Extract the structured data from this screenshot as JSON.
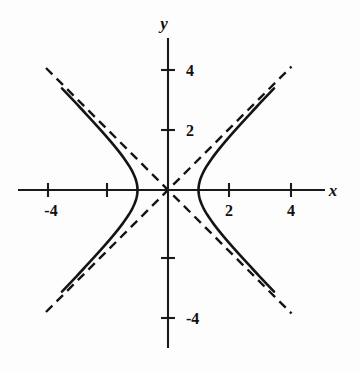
{
  "figure": {
    "background_color": "#fdfdfd",
    "ink_color": "#141414"
  },
  "axes": {
    "x_axis_label": "x",
    "y_axis_label": "y",
    "x_label_position": {
      "px": 333,
      "py": 196
    },
    "y_label_position": {
      "px": 164,
      "py": 29
    },
    "origin_px": {
      "x": 168,
      "y": 190
    },
    "pixels_per_unit": 30.5,
    "x_axis_extent_px": {
      "from": 18,
      "to": 325
    },
    "y_axis_extent_px": {
      "from": 38,
      "to": 348
    }
  },
  "ticks": {
    "x": [
      {
        "value": -4,
        "label": "-4",
        "px": 48,
        "labeled": true
      },
      {
        "value": -2,
        "label": "",
        "px": 107,
        "labeled": false
      },
      {
        "value": 2,
        "label": "2",
        "px": 229,
        "labeled": true
      },
      {
        "value": 4,
        "label": "4",
        "px": 291,
        "labeled": true
      }
    ],
    "y": [
      {
        "value": 4,
        "label": "4",
        "py": 70,
        "labeled": true
      },
      {
        "value": 2,
        "label": "2",
        "py": 130,
        "labeled": true
      },
      {
        "value": -2,
        "label": "",
        "py": 258,
        "labeled": false
      },
      {
        "value": -4,
        "label": "-4",
        "py": 318,
        "labeled": true
      }
    ]
  },
  "chart_data": {
    "type": "line",
    "title": "",
    "subtitle": "",
    "xlabel": "x",
    "ylabel": "y",
    "xlim": [
      -4.9,
      5.15
    ],
    "ylim": [
      -5.2,
      5.0
    ],
    "grid": false,
    "legend": null,
    "annotations": [],
    "equation": "x^2 - y^2 = 1",
    "curve_family": "hyperbola",
    "parameters": {
      "a": 1,
      "b": 1,
      "center": [
        0,
        0
      ],
      "orientation": "horizontal"
    },
    "vertices": [
      [
        -1,
        0
      ],
      [
        1,
        0
      ]
    ],
    "xticks": [
      -4,
      -2,
      2,
      4
    ],
    "xticklabels": [
      "-4",
      "",
      "2",
      "4"
    ],
    "yticks": [
      4,
      2,
      -2,
      -4
    ],
    "yticklabels": [
      "4",
      "2",
      "",
      "-4"
    ],
    "series": [
      {
        "name": "right branch",
        "style": "solid",
        "color": "#141414",
        "points": [
          [
            1.0,
            0.0
          ],
          [
            1.02,
            0.2
          ],
          [
            1.08,
            0.4
          ],
          [
            1.17,
            0.6
          ],
          [
            1.28,
            0.8
          ],
          [
            1.414,
            1.0
          ],
          [
            1.72,
            1.4
          ],
          [
            2.06,
            1.8
          ],
          [
            2.42,
            2.2
          ],
          [
            2.8,
            2.6
          ],
          [
            3.16,
            3.0
          ],
          [
            3.48,
            3.33
          ],
          [
            1.02,
            -0.2
          ],
          [
            1.08,
            -0.4
          ],
          [
            1.17,
            -0.6
          ],
          [
            1.28,
            -0.8
          ],
          [
            1.414,
            -1.0
          ],
          [
            1.72,
            -1.4
          ],
          [
            2.06,
            -1.8
          ],
          [
            2.42,
            -2.2
          ],
          [
            2.8,
            -2.6
          ],
          [
            3.16,
            -3.0
          ],
          [
            3.48,
            -3.33
          ]
        ]
      },
      {
        "name": "left branch",
        "style": "solid",
        "color": "#141414",
        "points": [
          [
            -1.0,
            0.0
          ],
          [
            -1.02,
            0.2
          ],
          [
            -1.08,
            0.4
          ],
          [
            -1.17,
            0.6
          ],
          [
            -1.28,
            0.8
          ],
          [
            -1.414,
            1.0
          ],
          [
            -1.72,
            1.4
          ],
          [
            -2.06,
            1.8
          ],
          [
            -2.42,
            2.2
          ],
          [
            -2.8,
            2.6
          ],
          [
            -3.16,
            3.0
          ],
          [
            -3.48,
            3.33
          ],
          [
            -1.02,
            -0.2
          ],
          [
            -1.08,
            -0.4
          ],
          [
            -1.17,
            -0.6
          ],
          [
            -1.28,
            -0.8
          ],
          [
            -1.414,
            -1.0
          ],
          [
            -1.72,
            -1.4
          ],
          [
            -2.06,
            -1.8
          ],
          [
            -2.42,
            -2.2
          ],
          [
            -2.8,
            -2.6
          ],
          [
            -3.16,
            -3.0
          ],
          [
            -3.48,
            -3.33
          ]
        ]
      },
      {
        "name": "asymptote y = x",
        "style": "dashed",
        "color": "#141414",
        "points": [
          [
            -4.0,
            -4.0
          ],
          [
            4.05,
            4.05
          ]
        ]
      },
      {
        "name": "asymptote y = -x",
        "style": "dashed",
        "color": "#141414",
        "points": [
          [
            -4.0,
            4.0
          ],
          [
            4.05,
            -4.05
          ]
        ]
      }
    ]
  }
}
